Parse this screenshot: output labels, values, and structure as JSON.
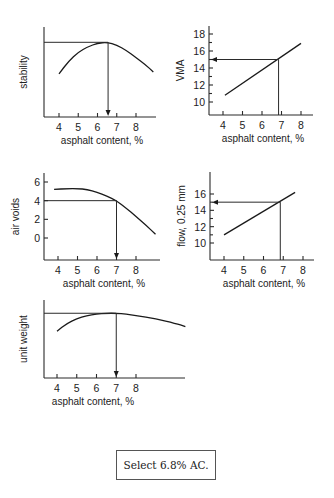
{
  "chart_data": [
    {
      "id": "stability",
      "type": "line",
      "xlabel": "asphalt content, %",
      "ylabel": "stability",
      "xticks": [
        "4",
        "5",
        "6",
        "7",
        "8"
      ],
      "yticks": [],
      "xlim": [
        3.25,
        9.0
      ],
      "ylim": [
        0,
        1
      ],
      "series": [
        {
          "name": "stability",
          "x": [
            4.0,
            4.5,
            5.0,
            5.5,
            6.0,
            6.5,
            7.0,
            7.5,
            8.0,
            8.5,
            8.9
          ],
          "y": [
            0.48,
            0.62,
            0.72,
            0.78,
            0.82,
            0.83,
            0.8,
            0.74,
            0.66,
            0.58,
            0.5
          ]
        }
      ],
      "guide": {
        "peak_x": 6.55,
        "peak_y": 0.83,
        "direction": "down"
      }
    },
    {
      "id": "vma",
      "type": "line",
      "xlabel": "asphalt content, %",
      "ylabel": "VMA",
      "xticks": [
        "4",
        "5",
        "6",
        "7",
        "8"
      ],
      "yticks": [
        "10",
        "12",
        "14",
        "16",
        "18"
      ],
      "xlim": [
        3.3,
        8.6
      ],
      "ylim": [
        8.5,
        19.5
      ],
      "series": [
        {
          "name": "VMA",
          "x": [
            4.1,
            8.0
          ],
          "y": [
            10.8,
            16.9
          ]
        }
      ],
      "guide": {
        "x": 6.85,
        "y": 15.0,
        "direction": "left"
      }
    },
    {
      "id": "air-voids",
      "type": "line",
      "xlabel": "asphalt content, %",
      "ylabel": "air voids",
      "xticks": [
        "4",
        "5",
        "6",
        "7",
        "8"
      ],
      "yticks": [
        "0",
        "2",
        "4",
        "6"
      ],
      "xlim": [
        3.3,
        9.2
      ],
      "ylim": [
        -2.3,
        7.0
      ],
      "series": [
        {
          "name": "air voids",
          "x": [
            3.8,
            4.5,
            5.0,
            5.5,
            6.0,
            6.5,
            7.0,
            7.5,
            8.0,
            8.5,
            9.0
          ],
          "y": [
            5.2,
            5.3,
            5.3,
            5.2,
            4.9,
            4.5,
            4.0,
            3.2,
            2.3,
            1.4,
            0.4
          ]
        }
      ],
      "guide": {
        "x": 7.0,
        "y": 4.0,
        "direction": "down"
      }
    },
    {
      "id": "flow",
      "type": "line",
      "xlabel": "asphalt content, %",
      "ylabel": "flow, 0.25 mm",
      "xticks": [
        "4",
        "5",
        "6",
        "7",
        "8"
      ],
      "yticks": [
        "10",
        "12",
        "14",
        "16"
      ],
      "xlim": [
        3.3,
        8.6
      ],
      "ylim": [
        8.0,
        19.0
      ],
      "series": [
        {
          "name": "flow",
          "x": [
            4.0,
            7.6
          ],
          "y": [
            11.0,
            16.2
          ]
        }
      ],
      "guide": {
        "x": 6.85,
        "y": 15.0,
        "direction": "left"
      }
    },
    {
      "id": "unit-weight",
      "type": "line",
      "xlabel": "asphalt content, %",
      "ylabel": "unit weight",
      "xticks": [
        "4",
        "5",
        "6",
        "7",
        "8"
      ],
      "yticks": [],
      "xlim": [
        3.3,
        10.5
      ],
      "ylim": [
        0,
        1
      ],
      "series": [
        {
          "name": "unit weight",
          "x": [
            4.0,
            4.5,
            5.0,
            5.5,
            6.0,
            6.5,
            7.0,
            7.5,
            8.0,
            9.0,
            10.0,
            10.5
          ],
          "y": [
            0.6,
            0.7,
            0.76,
            0.8,
            0.82,
            0.83,
            0.83,
            0.82,
            0.8,
            0.76,
            0.7,
            0.66
          ]
        }
      ],
      "guide": {
        "peak_x": 7.0,
        "peak_y": 0.83,
        "direction": "down"
      }
    }
  ],
  "note": "Select 6.8% AC."
}
